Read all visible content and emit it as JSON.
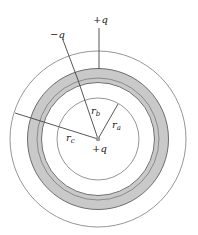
{
  "diagram": {
    "center": {
      "x": 98,
      "y": 139
    },
    "charges": {
      "center_label": "+q",
      "shell_outer_label": "+q",
      "shell_inner_label": "−q"
    },
    "radii_labels": {
      "ra": {
        "r": "r",
        "sub": "a"
      },
      "rb": {
        "r": "r",
        "sub": "b"
      },
      "rc": {
        "r": "r",
        "sub": "c"
      }
    },
    "colors": {
      "line": "#777777",
      "shell_fill": "#c8c8c8",
      "shell_edge": "#707070",
      "charge_dot": "#999999"
    }
  }
}
